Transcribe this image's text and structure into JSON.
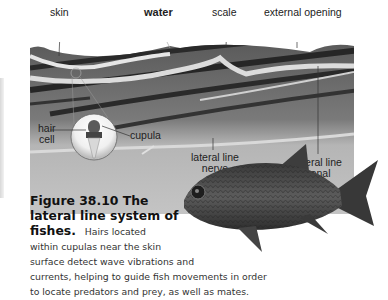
{
  "figure": {
    "labels": {
      "skin": "skin",
      "water": "water",
      "scale": "scale",
      "external_opening": "external opening",
      "hair_cell_1": "hair",
      "hair_cell_2": "cell",
      "cupula": "cupula",
      "lateral_line_nerve_1": "lateral line",
      "lateral_line_nerve_2": "nerve",
      "lateral_line_canal_1": "lateral line",
      "lateral_line_canal_2": "canal"
    },
    "caption": {
      "number": "Figure 38.10",
      "title_part1": "The",
      "title_part2": "lateral line system of",
      "title_part3": "fishes.",
      "body_lines": [
        "Hairs located",
        "within cupulas near the skin",
        "surface detect wave vibrations and",
        "currents, helping to guide fish movements in order",
        "to locate predators and prey, as well as mates."
      ]
    },
    "colors": {
      "tissue_dark": "#3a3a3a",
      "tissue_mid": "#8a8a8a",
      "tissue_light": "#c9c9c9",
      "fish_body": "#4a4a4a"
    }
  }
}
